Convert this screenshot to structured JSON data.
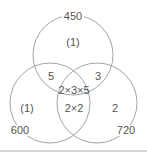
{
  "diagram": {
    "type": "venn-3",
    "stroke_color": "#9a9a9a",
    "text_color": "#555555",
    "sets": [
      {
        "label": "450",
        "cx": 73,
        "cy": 55,
        "r": 40,
        "label_x": 73,
        "label_y": 20
      },
      {
        "label": "600",
        "cx": 50,
        "cy": 103,
        "r": 40,
        "label_x": 20,
        "label_y": 134
      },
      {
        "label": "720",
        "cx": 97,
        "cy": 103,
        "r": 40,
        "label_x": 126,
        "label_y": 134
      }
    ],
    "regions": [
      {
        "id": "top-only",
        "text": "(1)",
        "x": 73,
        "y": 46
      },
      {
        "id": "top-left",
        "text": "5",
        "x": 51,
        "y": 80
      },
      {
        "id": "top-right",
        "text": "3",
        "x": 98,
        "y": 80
      },
      {
        "id": "center",
        "text": "2×3×5",
        "x": 74,
        "y": 94
      },
      {
        "id": "left-only",
        "text": "(1)",
        "x": 27,
        "y": 112
      },
      {
        "id": "bottom-center",
        "text": "2×2",
        "x": 74,
        "y": 112
      },
      {
        "id": "right-only",
        "text": "2",
        "x": 115,
        "y": 112
      }
    ]
  }
}
